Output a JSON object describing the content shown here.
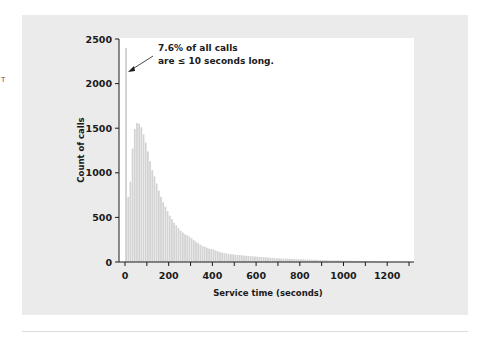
{
  "chart_data": {
    "type": "bar",
    "subtype": "histogram",
    "title": "",
    "xlabel": "Service time (seconds)",
    "ylabel": "Count of calls",
    "xlim": [
      0,
      1300
    ],
    "ylim": [
      0,
      2500
    ],
    "bin_width": 10,
    "x_ticks": [
      0,
      200,
      400,
      600,
      800,
      1000,
      1200
    ],
    "x_minor_ticks": [
      100,
      300,
      500,
      700,
      900,
      1100,
      1300
    ],
    "y_ticks": [
      0,
      500,
      1000,
      1500,
      2000,
      2500
    ],
    "grid": false,
    "legend": null,
    "annotation": {
      "line1": "7.6% of all calls",
      "line2": "are ≤ 10 seconds long.",
      "points_to_bin": 0
    },
    "bins": [
      0,
      10,
      20,
      30,
      40,
      50,
      60,
      70,
      80,
      90,
      100,
      110,
      120,
      130,
      140,
      150,
      160,
      170,
      180,
      190,
      200,
      210,
      220,
      230,
      240,
      250,
      260,
      270,
      280,
      290,
      300,
      310,
      320,
      330,
      340,
      350,
      360,
      370,
      380,
      390,
      400,
      410,
      420,
      430,
      440,
      450,
      460,
      470,
      480,
      490,
      500,
      510,
      520,
      530,
      540,
      550,
      560,
      570,
      580,
      590,
      600,
      610,
      620,
      630,
      640,
      650,
      660,
      670,
      680,
      690,
      700,
      710,
      720,
      730,
      740,
      750,
      760,
      770,
      780,
      790,
      800,
      810,
      820,
      830,
      840,
      850,
      860,
      870,
      880,
      890,
      900,
      910,
      920,
      930,
      940,
      950,
      960,
      970,
      980,
      990,
      1000,
      1010,
      1020,
      1030,
      1040,
      1050,
      1060,
      1070,
      1080,
      1090,
      1100,
      1110,
      1120,
      1130,
      1140,
      1150,
      1160,
      1170,
      1180,
      1190,
      1200,
      1210,
      1220,
      1230,
      1240,
      1250,
      1260,
      1270,
      1280,
      1290
    ],
    "values": [
      2400,
      730,
      900,
      1270,
      1490,
      1560,
      1550,
      1510,
      1430,
      1340,
      1240,
      1130,
      1030,
      960,
      880,
      800,
      730,
      670,
      620,
      570,
      520,
      480,
      440,
      410,
      380,
      350,
      330,
      310,
      300,
      285,
      265,
      245,
      225,
      210,
      195,
      180,
      170,
      160,
      150,
      145,
      140,
      130,
      120,
      110,
      105,
      100,
      95,
      90,
      88,
      85,
      82,
      80,
      78,
      75,
      72,
      70,
      68,
      66,
      64,
      62,
      60,
      58,
      56,
      54,
      52,
      50,
      48,
      46,
      44,
      42,
      41,
      40,
      39,
      38,
      37,
      36,
      35,
      34,
      33,
      32,
      31,
      30,
      29,
      28,
      27,
      26,
      25,
      24,
      23,
      22,
      21,
      20,
      20,
      19,
      19,
      18,
      18,
      17,
      17,
      16,
      16,
      15,
      15,
      14,
      14,
      13,
      13,
      12,
      12,
      11,
      11,
      10,
      10,
      9,
      9,
      8,
      8,
      7,
      7,
      6,
      6,
      5,
      5,
      5,
      4,
      4,
      4,
      3,
      3,
      3
    ]
  },
  "page": {
    "edge_mark": "T"
  },
  "colors": {
    "bar": "#d3d3d3",
    "panel": "#ebebeb",
    "plot_bg": "#ffffff",
    "axis": "#1a1a1a"
  }
}
